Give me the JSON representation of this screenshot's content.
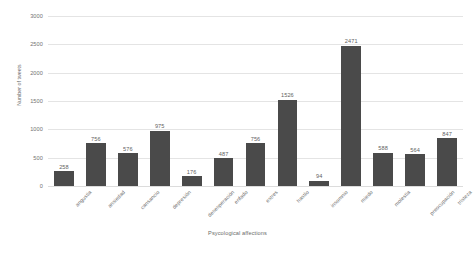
{
  "chart_data": {
    "type": "bar",
    "title": "",
    "xlabel": "Psycological affections",
    "ylabel": "Number of tweets",
    "ylim": [
      0,
      3000
    ],
    "yticks": [
      0,
      500,
      1000,
      1500,
      2000,
      2500,
      3000
    ],
    "grid": true,
    "legend": false,
    "bar_color": "#4a4a4a",
    "categories": [
      "angustia",
      "ansiedad",
      "cansancio",
      "depresión",
      "desesperación",
      "enfado",
      "estres",
      "hastío",
      "insomnio",
      "miedo",
      "molestia",
      "preocupación",
      "tristeza"
    ],
    "values": [
      258,
      756,
      576,
      975,
      176,
      487,
      756,
      1526,
      94,
      2471,
      588,
      564,
      847
    ],
    "data_labels": [
      "258",
      "756",
      "576",
      "975",
      "176",
      "487",
      "756",
      "1526",
      "94",
      "2471",
      "588",
      "564",
      "847"
    ]
  }
}
